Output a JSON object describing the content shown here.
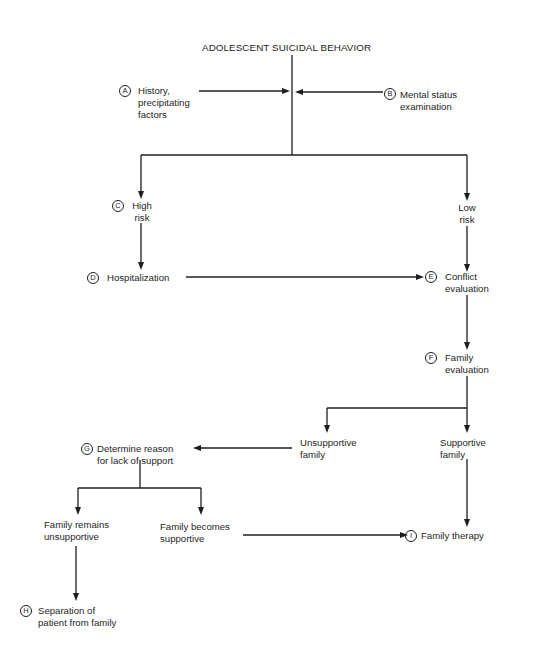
{
  "title": "ADOLESCENT SUICIDAL BEHAVIOR",
  "nodes": {
    "A": {
      "badge": "A",
      "line1": "History,",
      "line2": "precipitating",
      "line3": "factors"
    },
    "B": {
      "badge": "B",
      "line1": "Mental status",
      "line2": "examination"
    },
    "C": {
      "badge": "C",
      "line1": "High",
      "line2": "risk"
    },
    "low_risk": {
      "line1": "Low",
      "line2": "risk"
    },
    "D": {
      "badge": "D",
      "line1": "Hospitalization"
    },
    "E": {
      "badge": "E",
      "line1": "Conflict",
      "line2": "evaluation"
    },
    "F": {
      "badge": "F",
      "line1": "Family",
      "line2": "evaluation"
    },
    "unsupportive": {
      "line1": "Unsupportive",
      "line2": "family"
    },
    "supportive": {
      "line1": "Supportive",
      "line2": "family"
    },
    "G": {
      "badge": "G",
      "line1": "Determine reason",
      "line2": "for lack of support"
    },
    "remains": {
      "line1": "Family remains",
      "line2": "unsupportive"
    },
    "becomes": {
      "line1": "Family becomes",
      "line2": "supportive"
    },
    "H": {
      "badge": "H",
      "line1": "Separation of",
      "line2": "patient from family"
    },
    "I": {
      "badge": "I",
      "line1": "Family therapy"
    }
  },
  "edges": [
    {
      "from": "A",
      "to": "main-stem"
    },
    {
      "from": "B",
      "to": "main-stem"
    },
    {
      "from": "title",
      "to": "C"
    },
    {
      "from": "title",
      "to": "low_risk"
    },
    {
      "from": "C",
      "to": "D"
    },
    {
      "from": "low_risk",
      "to": "E"
    },
    {
      "from": "D",
      "to": "E"
    },
    {
      "from": "E",
      "to": "F"
    },
    {
      "from": "F",
      "to": "unsupportive"
    },
    {
      "from": "F",
      "to": "supportive"
    },
    {
      "from": "unsupportive",
      "to": "G"
    },
    {
      "from": "G",
      "to": "remains"
    },
    {
      "from": "G",
      "to": "becomes"
    },
    {
      "from": "remains",
      "to": "H"
    },
    {
      "from": "becomes",
      "to": "I"
    },
    {
      "from": "supportive",
      "to": "I"
    }
  ]
}
